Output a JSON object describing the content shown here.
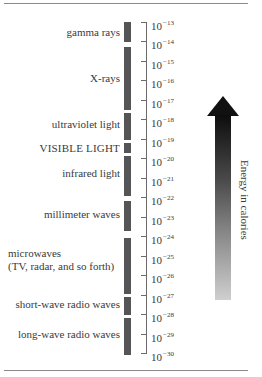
{
  "diagram": {
    "type": "electromagnetic-spectrum-energy-scale",
    "bands": [
      {
        "label": "gamma rays",
        "top": 22,
        "height": 20,
        "label_top": 26
      },
      {
        "label": "X-rays",
        "top": 47,
        "height": 63,
        "label_top": 72
      },
      {
        "label": "ultraviolet light",
        "top": 113,
        "height": 27,
        "label_top": 118
      },
      {
        "label": "VISIBLE LIGHT",
        "top": 143,
        "height": 10,
        "label_top": 142
      },
      {
        "label": "infrared light",
        "top": 156,
        "height": 40,
        "label_top": 167
      },
      {
        "label": "millimeter waves",
        "top": 201,
        "height": 30,
        "label_top": 208
      },
      {
        "label": "microwaves",
        "label2": "(TV, radar, and so forth)",
        "top": 238,
        "height": 56,
        "label_top": 247
      },
      {
        "label": "short-wave radio waves",
        "top": 297,
        "height": 18,
        "label_top": 298
      },
      {
        "label": "long-wave radio waves",
        "top": 318,
        "height": 37,
        "label_top": 328
      }
    ],
    "ticks": [
      {
        "base": "10",
        "exp": "−13",
        "y": 22
      },
      {
        "base": "10",
        "exp": "−14",
        "y": 41
      },
      {
        "base": "10",
        "exp": "−15",
        "y": 61
      },
      {
        "base": "10",
        "exp": "−16",
        "y": 80
      },
      {
        "base": "10",
        "exp": "−17",
        "y": 100
      },
      {
        "base": "10",
        "exp": "−18",
        "y": 119
      },
      {
        "base": "10",
        "exp": "−19",
        "y": 139
      },
      {
        "base": "10",
        "exp": "−20",
        "y": 158
      },
      {
        "base": "10",
        "exp": "−21",
        "y": 178
      },
      {
        "base": "10",
        "exp": "−22",
        "y": 197
      },
      {
        "base": "10",
        "exp": "−23",
        "y": 217
      },
      {
        "base": "10",
        "exp": "−24",
        "y": 236
      },
      {
        "base": "10",
        "exp": "−25",
        "y": 256
      },
      {
        "base": "10",
        "exp": "−26",
        "y": 275
      },
      {
        "base": "10",
        "exp": "−27",
        "y": 295
      },
      {
        "base": "10",
        "exp": "−28",
        "y": 314
      },
      {
        "base": "10",
        "exp": "−29",
        "y": 334
      },
      {
        "base": "10",
        "exp": "−30",
        "y": 353
      }
    ],
    "arrow_label": "Energy in calories",
    "colors": {
      "bar": "#555558",
      "arrow_top": "#0d0d0d",
      "arrow_bottom": "#cfcfcf"
    }
  }
}
